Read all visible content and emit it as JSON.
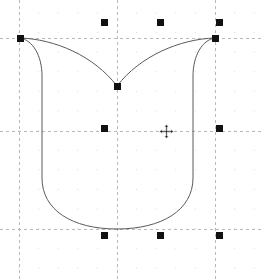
{
  "app": {
    "name": "vector-shape-editor-canvas",
    "view_title": "Shape selection canvas",
    "canvas_width": 264,
    "canvas_height": 280,
    "background_color": "#ffffff"
  },
  "colors": {
    "background": "#ffffff",
    "shape_stroke": "#5a5a5a",
    "shape_fill": "none",
    "handle_fill": "#111111",
    "guide_line": "#b9b9b9",
    "grid_dot": "#d9d9d9",
    "cursor": "#222222"
  },
  "shape": {
    "name": "tulip-outline",
    "type": "closed-bezier-path",
    "stroke_width": 1,
    "fill": "none",
    "path": "M 20,38 C 33,40 42,56 42,76 L 42,178 C 42,210 72,229 117,229 C 162,229 193,210 193,178 L 193,76 C 193,56 202,40 215,38 C 180,39 140,56 117,86 C 94,56 55,39 20,38 Z",
    "notch_apex": {
      "x": 117,
      "y": 86
    },
    "bottom_apex": {
      "x": 117,
      "y": 229
    }
  },
  "selection": {
    "label": "selection-handles",
    "count": 8,
    "handle_size": 7,
    "handles": [
      {
        "name": "handle-top-notch",
        "x": 117,
        "y": 86,
        "role": "path-node"
      },
      {
        "name": "handle-top-left",
        "x": 20,
        "y": 38,
        "role": "corner"
      },
      {
        "name": "handle-top-right",
        "x": 215,
        "y": 38,
        "role": "corner"
      },
      {
        "name": "handle-top-row-left",
        "x": 104,
        "y": 22,
        "role": "scale-top"
      },
      {
        "name": "handle-top-row-center",
        "x": 160,
        "y": 22,
        "role": "scale-top"
      },
      {
        "name": "handle-top-row-right",
        "x": 219,
        "y": 22,
        "role": "scale-top-right"
      },
      {
        "name": "handle-middle-left",
        "x": 104,
        "y": 128,
        "role": "scale-middle"
      },
      {
        "name": "handle-middle-right",
        "x": 219,
        "y": 128,
        "role": "scale-middle-right"
      },
      {
        "name": "handle-bottom-left",
        "x": 104,
        "y": 235,
        "role": "scale-bottom"
      },
      {
        "name": "handle-bottom-center",
        "x": 160,
        "y": 235,
        "role": "scale-bottom"
      },
      {
        "name": "handle-bottom-right",
        "x": 219,
        "y": 235,
        "role": "scale-bottom-right"
      }
    ]
  },
  "guides": {
    "label": "alignment-guides",
    "style": "dashed",
    "vertical": [
      {
        "name": "guide-vertical-left",
        "x": 19
      },
      {
        "name": "guide-vertical-center",
        "x": 117
      },
      {
        "name": "guide-vertical-right",
        "x": 215
      }
    ],
    "horizontal": [
      {
        "name": "guide-horizontal-top",
        "y": 38
      },
      {
        "name": "guide-horizontal-middle",
        "y": 131
      },
      {
        "name": "guide-horizontal-bottom",
        "y": 229
      }
    ]
  },
  "grid": {
    "label": "dot-grid",
    "spacing": 19.6,
    "origin_x": 19,
    "origin_y": 13,
    "dot_size": 1
  },
  "cursor": {
    "name": "move-cursor",
    "glyph": "move-four-arrow",
    "x": 166,
    "y": 131
  }
}
